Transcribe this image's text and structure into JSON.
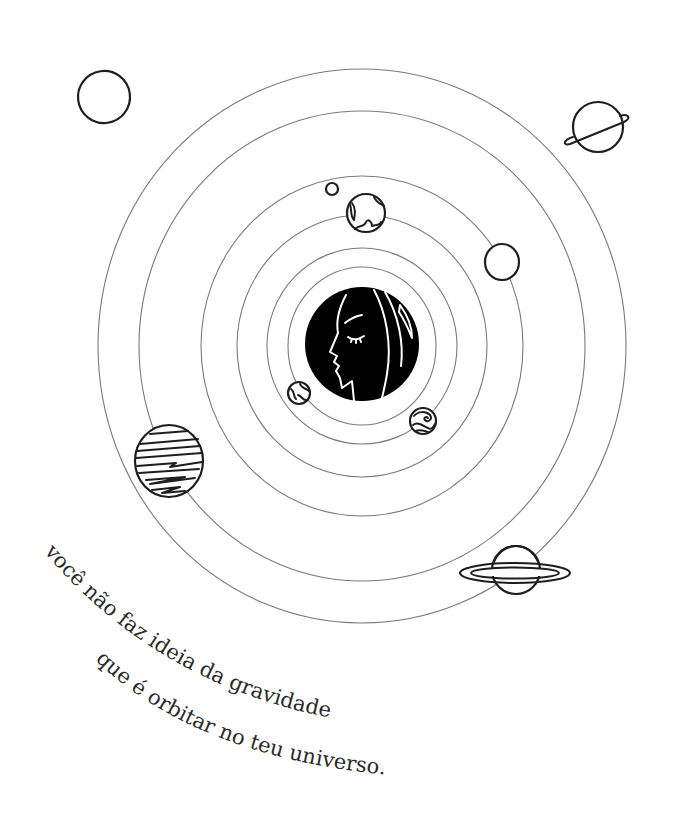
{
  "illustration": {
    "title": "solar system with woman's profile as the sun",
    "colors": {
      "background": "#ffffff",
      "ink": "#1e1e1e",
      "orbit": "#7a7a7a",
      "text": "#2a2a2a",
      "sun_fill": "#000000"
    },
    "center": {
      "x": 362,
      "y": 346
    },
    "orbits": [
      {
        "rx": 74,
        "ry": 79
      },
      {
        "rx": 95,
        "ry": 98
      },
      {
        "rx": 125,
        "ry": 131
      },
      {
        "rx": 161,
        "ry": 170
      },
      {
        "rx": 223,
        "ry": 235
      },
      {
        "rx": 264,
        "ry": 277
      }
    ],
    "sun": {
      "label": "woman-profile-sun",
      "cx": 362,
      "cy": 344,
      "r": 57
    },
    "planets": [
      {
        "name": "outline-planet-top-left",
        "cx": 104,
        "cy": 97,
        "r": 26
      },
      {
        "name": "ringed-planet-top-right",
        "cx": 598,
        "cy": 127,
        "r": 25
      },
      {
        "name": "tiny-moon",
        "cx": 332,
        "cy": 189,
        "r": 6
      },
      {
        "name": "earth-planet",
        "cx": 366,
        "cy": 213,
        "r": 19
      },
      {
        "name": "outline-planet-right",
        "cx": 502,
        "cy": 262,
        "r": 17
      },
      {
        "name": "striped-planet",
        "cx": 169,
        "cy": 461,
        "r": 34
      },
      {
        "name": "small-earth-planet",
        "cx": 299,
        "cy": 393,
        "r": 11
      },
      {
        "name": "swirl-planet",
        "cx": 423,
        "cy": 421,
        "r": 13
      },
      {
        "name": "saturn-planet",
        "cx": 516,
        "cy": 570,
        "r": 24
      }
    ]
  },
  "caption": {
    "line1": "você não faz ideia da gravidade",
    "line2": "que é orbitar no teu universo."
  }
}
